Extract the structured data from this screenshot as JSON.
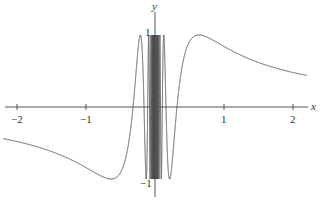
{
  "chart_data": {
    "type": "line",
    "title": "",
    "function": "y = sin(1/x)",
    "xlabel": "x",
    "ylabel": "y",
    "xlim": [
      -2.2,
      2.2
    ],
    "ylim": [
      -1.15,
      1.25
    ],
    "x_ticks": [
      "-2",
      "-1",
      "1",
      "2"
    ],
    "y_ticks": [
      "1",
      "-1"
    ],
    "grid": false,
    "legend": "none",
    "series": [
      {
        "name": "sin(1/x)",
        "color": "#555555",
        "sample_points": [
          {
            "x": -2,
            "y": -0.479
          },
          {
            "x": -1,
            "y": -0.841
          },
          {
            "x": -0.637,
            "y": -1
          },
          {
            "x": -0.318,
            "y": 0
          },
          {
            "x": -0.212,
            "y": 1
          },
          {
            "x": 0.212,
            "y": -1
          },
          {
            "x": 0.318,
            "y": 0
          },
          {
            "x": 0.637,
            "y": 1
          },
          {
            "x": 1,
            "y": 0.841
          },
          {
            "x": 2,
            "y": 0.479
          }
        ]
      }
    ]
  },
  "axes": {
    "x_label": "x",
    "y_label": "y",
    "tick_x": [
      "−2",
      "−1",
      "1",
      "2"
    ],
    "tick_y_top": "1",
    "tick_y_bottom": "−1"
  }
}
